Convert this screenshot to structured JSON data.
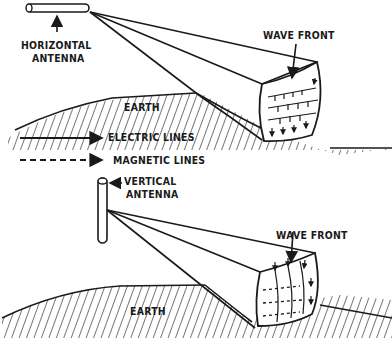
{
  "diagram": {
    "top_panel": {
      "antenna_label_line1": "HORIZONTAL",
      "antenna_label_line2": "ANTENNA",
      "wave_front_label": "WAVE FRONT",
      "earth_label": "EARTH"
    },
    "legend": {
      "electric_label": "ELECTRIC LINES",
      "magnetic_label": "MAGNETIC LINES"
    },
    "bottom_panel": {
      "antenna_label_line1": "VERTICAL",
      "antenna_label_line2": "ANTENNA",
      "wave_front_label": "WAVE FRONT",
      "earth_label": "EARTH"
    },
    "colors": {
      "ink": "#1a1a1a",
      "background": "#ffffff"
    }
  }
}
